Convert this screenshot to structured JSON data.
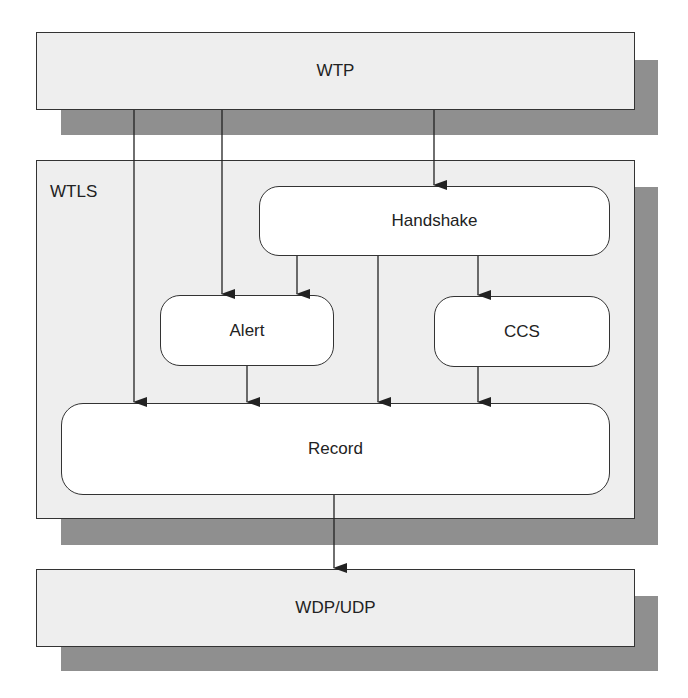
{
  "diagram": {
    "layers": {
      "wtp": {
        "label": "WTP"
      },
      "wtls": {
        "label": "WTLS"
      },
      "wdp": {
        "label": "WDP/UDP"
      }
    },
    "modules": {
      "handshake": {
        "label": "Handshake"
      },
      "alert": {
        "label": "Alert"
      },
      "ccs": {
        "label": "CCS"
      },
      "record": {
        "label": "Record"
      }
    },
    "edges": [
      {
        "from": "WTP",
        "to": "Record"
      },
      {
        "from": "WTP",
        "to": "Alert"
      },
      {
        "from": "WTP",
        "to": "Handshake"
      },
      {
        "from": "Handshake",
        "to": "Alert"
      },
      {
        "from": "Handshake",
        "to": "Record"
      },
      {
        "from": "Handshake",
        "to": "CCS"
      },
      {
        "from": "Alert",
        "to": "Record"
      },
      {
        "from": "CCS",
        "to": "Record"
      },
      {
        "from": "Record",
        "to": "WDP/UDP"
      }
    ],
    "colors": {
      "layer_fill": "#eeeeee",
      "shadow": "#8f8f8f",
      "module_fill": "#ffffff",
      "stroke": "#333333"
    }
  }
}
